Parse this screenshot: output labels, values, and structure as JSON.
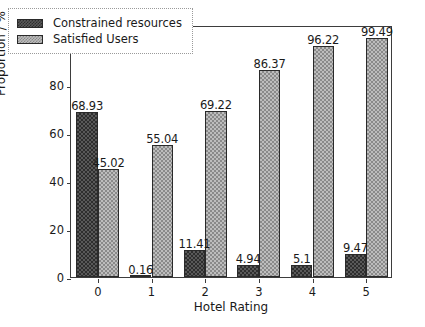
{
  "chart_data": {
    "type": "bar",
    "title": "",
    "subtitle": "",
    "xlabel": "Hotel Rating",
    "ylabel": "Proportion / %",
    "categories": [
      "0",
      "1",
      "2",
      "3",
      "4",
      "5"
    ],
    "xlim": [
      -0.5,
      5.5
    ],
    "ylim": [
      0,
      105
    ],
    "ytick_labels": [
      "0",
      "20",
      "40",
      "60",
      "80",
      "100"
    ],
    "ytick_values": [
      0,
      20,
      40,
      60,
      80,
      100
    ],
    "xtick_labels": [
      "0",
      "1",
      "2",
      "3",
      "4",
      "5"
    ],
    "grid": false,
    "legend_position": "upper left",
    "series": [
      {
        "name": "Constrained resources",
        "color": "#595959",
        "hatch": "checkered-dark",
        "values": [
          68.93,
          0.16,
          11.41,
          4.94,
          5.1,
          9.47
        ],
        "labels": [
          "68.93",
          "0.16",
          "11.41",
          "4.94",
          "5.1",
          "9.47"
        ]
      },
      {
        "name": "Satisfied Users",
        "color": "#bdbdbd",
        "hatch": "checkered-light",
        "values": [
          45.02,
          55.04,
          69.22,
          86.37,
          96.22,
          99.49
        ],
        "labels": [
          "45.02",
          "55.04",
          "69.22",
          "86.37",
          "96.22",
          "99.49"
        ]
      }
    ]
  },
  "legend": {
    "items": [
      {
        "label": "Constrained resources"
      },
      {
        "label": "Satisfied Users"
      }
    ]
  },
  "colors": {
    "series_dark": "#595959",
    "series_light": "#bdbdbd",
    "axis": "#3d3d3d",
    "text": "#1a1a1a",
    "background": "#ffffff"
  }
}
